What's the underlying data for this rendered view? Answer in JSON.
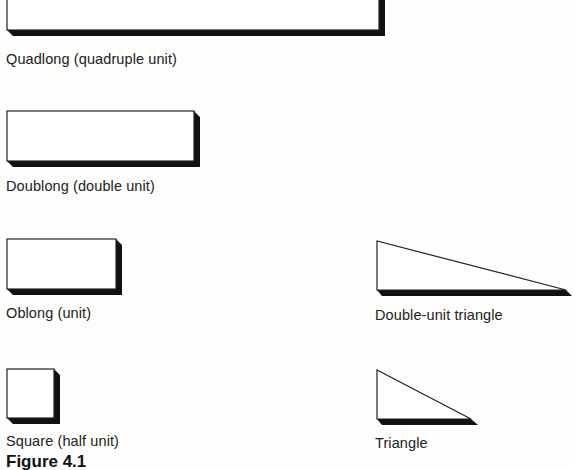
{
  "figure": {
    "caption": "Figure 4.1",
    "shapes": [
      {
        "id": "quadlong",
        "label": "Quadlong (quadruple unit)"
      },
      {
        "id": "doublong",
        "label": "Doublong (double unit)"
      },
      {
        "id": "oblong",
        "label": "Oblong (unit)"
      },
      {
        "id": "square",
        "label": "Square (half unit)"
      },
      {
        "id": "double-unit-triangle",
        "label": "Double-unit triangle"
      },
      {
        "id": "triangle",
        "label": "Triangle"
      }
    ]
  }
}
